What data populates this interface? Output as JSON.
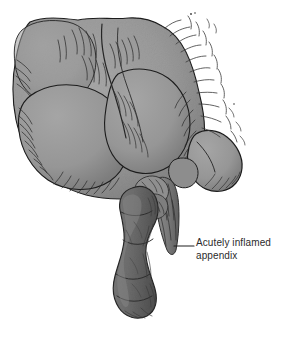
{
  "figure": {
    "kind": "medical-illustration",
    "background_color": "#ffffff",
    "width": 300,
    "height": 337
  },
  "annotations": [
    {
      "id": "appendix-callout",
      "text": "Acutely inflamed\nappendix",
      "line1": "Acutely inflamed",
      "line2": "appendix",
      "text_color": "#2b2b2b",
      "leader_color": "#1f1f1f",
      "leader_x1": 174,
      "leader_x2": 194,
      "leader_y": 246,
      "text_x": 196,
      "text_y": 236
    }
  ],
  "anatomy": {
    "cecum": {
      "name": "cecum",
      "fill": "#9b9b9b",
      "shadow": "#828282",
      "outline": "#1e1e1e"
    },
    "ileum_loop": {
      "name": "ileum-loop",
      "fill": "#959595",
      "outline": "#1e1e1e"
    },
    "appendix": {
      "name": "appendix",
      "fill": "#6d6d6d",
      "shadow": "#565656",
      "outline": "#2a2a2a"
    },
    "mesoappendix": {
      "name": "mesoappendix",
      "fill": "#7d7d7d",
      "outline": "#333333"
    },
    "cut_peritoneum_fringe": {
      "name": "cut-peritoneum-fringe",
      "stroke": "#3a3a3a"
    }
  },
  "palette": {
    "paper": "#ffffff",
    "tissue_light": "#9b9b9b",
    "tissue_mid": "#8a8a8a",
    "tissue_dark": "#6d6d6d",
    "ink": "#1e1e1e",
    "hatch": "#313131"
  }
}
